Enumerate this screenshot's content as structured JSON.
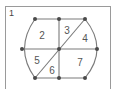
{
  "figure": {
    "number": "1",
    "colors": {
      "line": "#7a7a7a",
      "point": "#4a4a4a",
      "frame": "#9a9a9a",
      "label": "#555555"
    },
    "points": [
      {
        "id": "top-left",
        "x": 35,
        "y": 19
      },
      {
        "id": "top-mid",
        "x": 59,
        "y": 19
      },
      {
        "id": "top-right",
        "x": 85,
        "y": 19
      },
      {
        "id": "mid-left",
        "x": 22,
        "y": 49
      },
      {
        "id": "center",
        "x": 59,
        "y": 49
      },
      {
        "id": "mid-right",
        "x": 97,
        "y": 49
      },
      {
        "id": "bottom-left",
        "x": 35,
        "y": 78
      },
      {
        "id": "bottom-mid",
        "x": 59,
        "y": 78
      },
      {
        "id": "bottom-right",
        "x": 85,
        "y": 78
      }
    ],
    "regions": [
      {
        "label": "2",
        "x": 42,
        "y": 36
      },
      {
        "label": "3",
        "x": 67,
        "y": 31
      },
      {
        "label": "4",
        "x": 85,
        "y": 39
      },
      {
        "label": "5",
        "x": 37,
        "y": 61
      },
      {
        "label": "6",
        "x": 52,
        "y": 71
      },
      {
        "label": "7",
        "x": 80,
        "y": 63
      }
    ]
  }
}
